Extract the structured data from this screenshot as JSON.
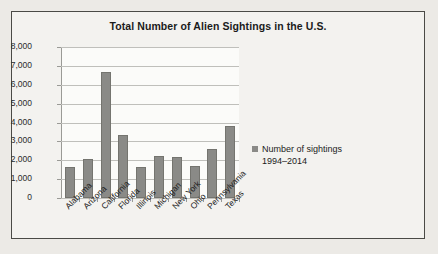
{
  "chart_data": {
    "type": "bar",
    "title": "Total Number of Alien Sightings in the U.S.",
    "xlabel": "",
    "ylabel": "",
    "categories": [
      "Alabama",
      "Arizona",
      "California",
      "Florida",
      "Illinois",
      "Michigan",
      "New York",
      "Ohio",
      "Pennsylvania",
      "Texas"
    ],
    "values": [
      1650,
      2050,
      6700,
      3350,
      1650,
      2250,
      2150,
      1700,
      2600,
      3800
    ],
    "series": [
      {
        "name": "Number of sightings 1994–2014",
        "values": [
          1650,
          2050,
          6700,
          3350,
          1650,
          2250,
          2150,
          1700,
          2600,
          3800
        ]
      }
    ],
    "ylim": [
      0,
      8000
    ],
    "ytick_labels": [
      "8,000",
      "7,000",
      "6,000",
      "5,000",
      "4,000",
      "3,000",
      "2,000",
      "1,000",
      "0"
    ],
    "ytick_values": [
      8000,
      7000,
      6000,
      5000,
      4000,
      3000,
      2000,
      1000,
      0
    ],
    "grid": true,
    "legend_position": "right",
    "bar_color": "#8a8a87"
  },
  "legend": {
    "line1": "Number of sightings",
    "line2": "1994–2014"
  }
}
